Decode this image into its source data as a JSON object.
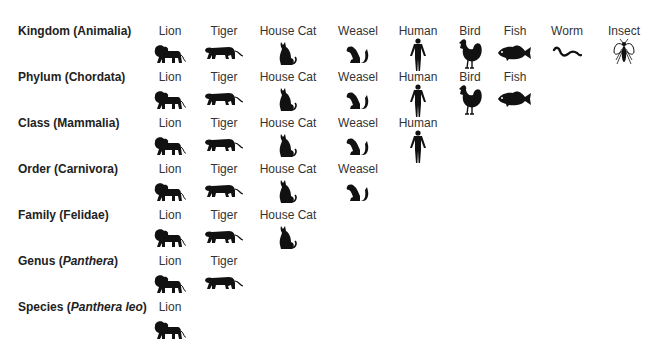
{
  "columns": {
    "lion": {
      "x": 170,
      "label": "Lion",
      "icon": "lion-icon"
    },
    "tiger": {
      "x": 224,
      "label": "Tiger",
      "icon": "tiger-icon"
    },
    "cat": {
      "x": 288,
      "label": "House Cat",
      "icon": "house-cat-icon"
    },
    "weasel": {
      "x": 358,
      "label": "Weasel",
      "icon": "weasel-icon"
    },
    "human": {
      "x": 418,
      "label": "Human",
      "icon": "human-icon"
    },
    "bird": {
      "x": 470,
      "label": "Bird",
      "icon": "bird-icon"
    },
    "fish": {
      "x": 515,
      "label": "Fish",
      "icon": "fish-icon"
    },
    "worm": {
      "x": 567,
      "label": "Worm",
      "icon": "worm-icon"
    },
    "insect": {
      "x": 624,
      "label": "Insect",
      "icon": "insect-icon"
    }
  },
  "rows": [
    {
      "rank": "Kingdom",
      "taxon": "Animalia",
      "italic": false,
      "y": 24,
      "members": [
        "lion",
        "tiger",
        "cat",
        "weasel",
        "human",
        "bird",
        "fish",
        "worm",
        "insect"
      ]
    },
    {
      "rank": "Phylum",
      "taxon": "Chordata",
      "italic": false,
      "y": 70,
      "members": [
        "lion",
        "tiger",
        "cat",
        "weasel",
        "human",
        "bird",
        "fish"
      ]
    },
    {
      "rank": "Class",
      "taxon": "Mammalia",
      "italic": false,
      "y": 116,
      "members": [
        "lion",
        "tiger",
        "cat",
        "weasel",
        "human"
      ]
    },
    {
      "rank": "Order",
      "taxon": "Carnivora",
      "italic": false,
      "y": 162,
      "members": [
        "lion",
        "tiger",
        "cat",
        "weasel"
      ]
    },
    {
      "rank": "Family",
      "taxon": "Felidae",
      "italic": false,
      "y": 208,
      "members": [
        "lion",
        "tiger",
        "cat"
      ]
    },
    {
      "rank": "Genus",
      "taxon": "Panthera",
      "italic": true,
      "y": 254,
      "members": [
        "lion",
        "tiger"
      ]
    },
    {
      "rank": "Species",
      "taxon": "Panthera leo",
      "italic": true,
      "y": 300,
      "members": [
        "lion"
      ]
    }
  ],
  "row_labels": [
    "Kingdom (Animalia)",
    "Phylum (Chordata)",
    "Class (Mammalia)",
    "Order (Carnivora)",
    "Family (Felidae)",
    "Genus (Panthera)",
    "Species (Panthera leo)"
  ]
}
